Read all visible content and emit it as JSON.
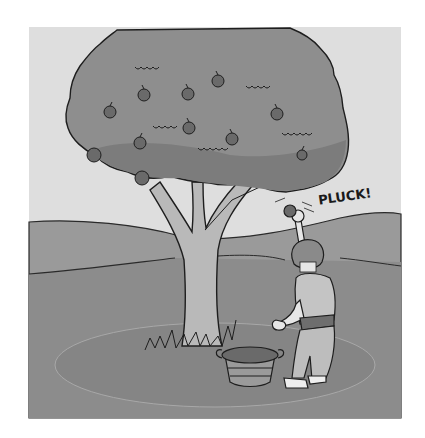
{
  "illustration": {
    "description": "Grayscale cartoon of a boy picking an apple from an apple tree, with a wooden basket on the ground",
    "sound_effect": "PLUCK!",
    "colors": {
      "background": "#ffffff",
      "sky": "#dedede",
      "canopy": "#8e8e8e",
      "canopy_shade": "#7c7c7c",
      "hills": "#9a9a9a",
      "ground": "#8c8c8c",
      "trunk": "#b9b9b9",
      "apple": "#6a6a6a",
      "outline": "#1e1e1e",
      "shirt": "#c4c4c4",
      "pants": "#bdbdbd",
      "skin": "#e6e6e6",
      "hair": "#8a8a8a"
    },
    "elements": [
      "apple-tree",
      "apples",
      "boy",
      "basket",
      "hills",
      "shadow-circle"
    ]
  }
}
